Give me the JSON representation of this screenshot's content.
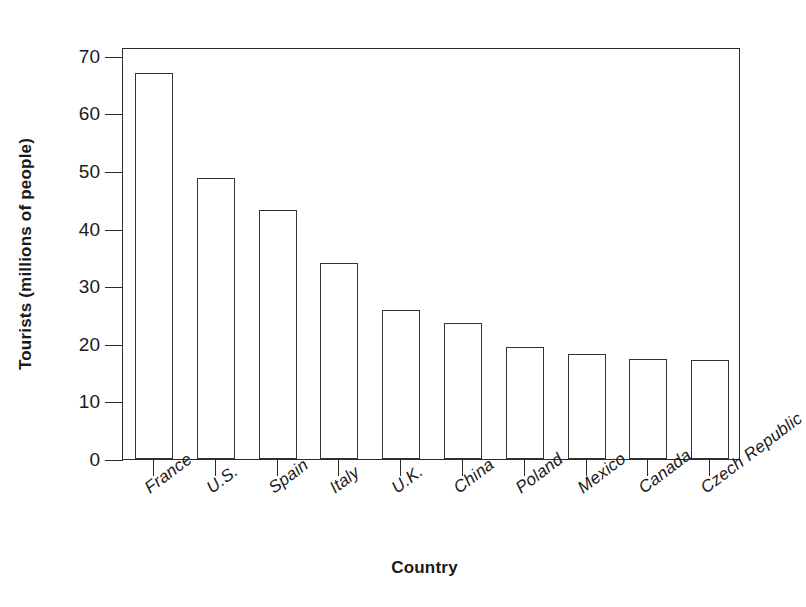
{
  "chart_data": {
    "type": "bar",
    "title": "",
    "subtitle": "",
    "xlabel": "Country",
    "ylabel": "Tourists (millions of people)",
    "categories": [
      "France",
      "U.S.",
      "Spain",
      "Italy",
      "U.K.",
      "China",
      "Poland",
      "Mexico",
      "Canada",
      "Czech Republic"
    ],
    "values": [
      67,
      48.8,
      43.3,
      34.1,
      25.8,
      23.6,
      19.4,
      18.3,
      17.3,
      17.1
    ],
    "ylim": [
      0,
      71.5
    ],
    "yticks": [
      0,
      10,
      20,
      30,
      40,
      50,
      60,
      70
    ],
    "ytick_labels": [
      "0",
      "10",
      "20",
      "30",
      "40",
      "50",
      "60",
      "70"
    ],
    "grid": false,
    "legend": false,
    "legend_position": "none",
    "bar_fill_color": "#ffffff",
    "bar_edge_color": "#333333",
    "axis_color": "#2b2b2b",
    "background_color": "#ffffff"
  }
}
